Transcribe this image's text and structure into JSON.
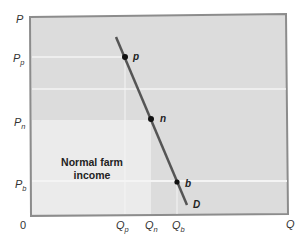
{
  "diagram": {
    "type": "demand-curve",
    "axes": {
      "y_label": "P",
      "x_label": "Q",
      "origin": "0"
    },
    "y_ticks": [
      {
        "base": "P",
        "sub": "p",
        "y": 58
      },
      {
        "base": "P",
        "sub": "n",
        "y": 122
      },
      {
        "base": "P",
        "sub": "b",
        "y": 184
      }
    ],
    "x_ticks": [
      {
        "base": "Q",
        "sub": "p",
        "x": 120
      },
      {
        "base": "Q",
        "sub": "n",
        "x": 148
      },
      {
        "base": "Q",
        "sub": "b",
        "x": 174
      }
    ],
    "points": [
      {
        "label": "p",
        "x": 125,
        "y": 57
      },
      {
        "label": "n",
        "x": 151,
        "y": 119
      },
      {
        "label": "b",
        "x": 177,
        "y": 182
      }
    ],
    "curve": {
      "label": "D",
      "x1": 116,
      "y1": 37,
      "x2": 187,
      "y2": 205
    },
    "region": {
      "label_line1": "Normal farm",
      "label_line2": "income"
    },
    "colors": {
      "plot_bg": "#dcdcdc",
      "region_bg": "#ebebeb",
      "border": "#8c8c8c",
      "curve": "#555555",
      "guide": "#f4f4f4"
    }
  }
}
